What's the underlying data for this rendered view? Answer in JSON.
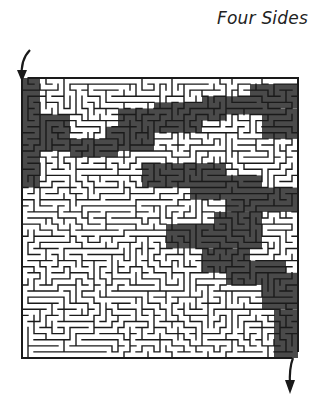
{
  "title": "Four Sides",
  "maze": {
    "cols": 46,
    "rows": 46,
    "seed": 20250,
    "wall_color": "#1a1a1a",
    "shade_color": "#4a4a4a",
    "background": "#ffffff",
    "entrance": "top-left",
    "exit": "bottom-right"
  },
  "icons": {
    "entry_arrow": "arrow-down-curved-icon",
    "exit_arrow": "arrow-down-icon"
  }
}
